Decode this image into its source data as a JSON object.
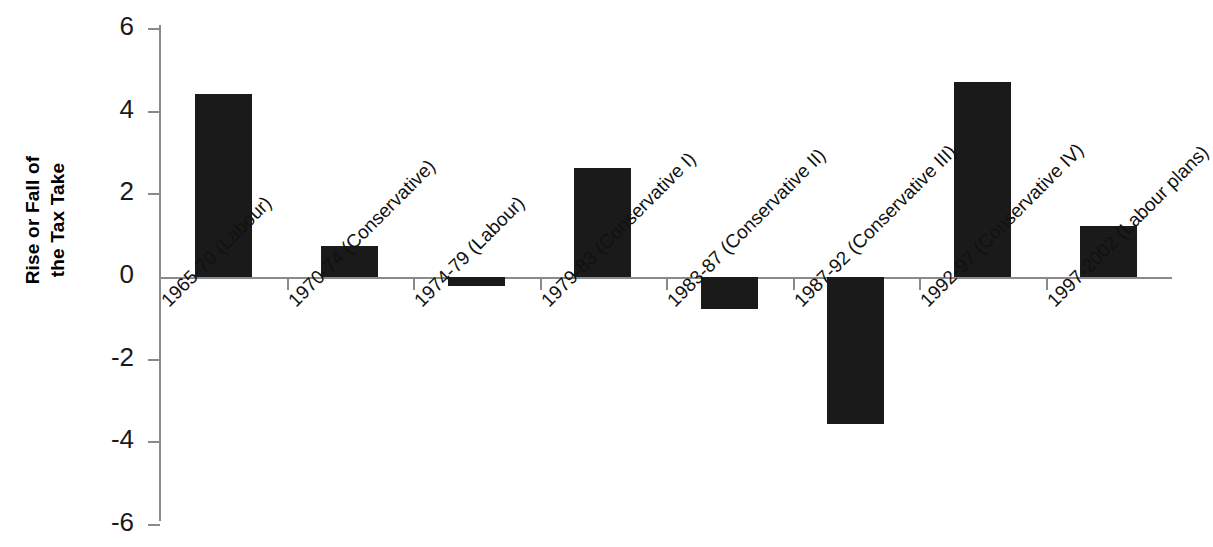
{
  "chart_data": {
    "type": "bar",
    "title": "",
    "xlabel": "",
    "ylabel": "Rise or Fall of the Tax Take",
    "ylabel_lines": [
      "Rise or Fall of",
      "the Tax Take"
    ],
    "ylim": [
      -6,
      6
    ],
    "ytick_labels": [
      "6",
      "4",
      "2",
      "0",
      "-2",
      "-4",
      "-6"
    ],
    "ytick_values": [
      6,
      4,
      2,
      0,
      -2,
      -4,
      -6
    ],
    "grid": false,
    "legend": "none",
    "bar_color": "#1a1a1a",
    "axis_color": "#8a8a8a",
    "categories": [
      "1965-70 (Labour)",
      "1970-74 (Conservative)",
      "1974-79 (Labour)",
      "1979-83 (Conservative I)",
      "1983-87 (Conservative II)",
      "1987-92 (Conservative III)",
      "1992-97 (Conservative IV)",
      "1997-2002 (Labour plans)"
    ],
    "values": [
      4.42,
      0.75,
      -0.22,
      2.65,
      -0.78,
      -3.55,
      4.73,
      1.24
    ]
  }
}
